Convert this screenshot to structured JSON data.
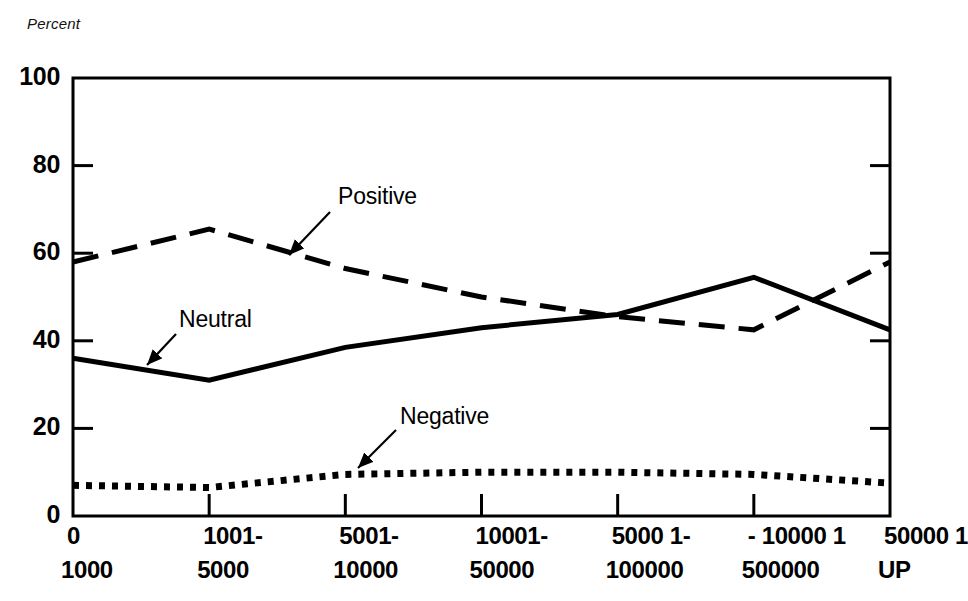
{
  "chart_data": {
    "type": "line",
    "title": "",
    "ylabel": "Percent",
    "xlabel": "",
    "ylim": [
      0,
      100
    ],
    "yticks": [
      "0",
      "20",
      "40",
      "60",
      "80",
      "100"
    ],
    "ytick_values": [
      0,
      20,
      40,
      60,
      80,
      100
    ],
    "grid": false,
    "legend_position": "inline-annotations",
    "categories": [
      "0 1000",
      "1001- 5000",
      "5001- 10000",
      "10001- 50000",
      "5000 1- 100000",
      "- 10000 1 500000",
      "50000 1 UP"
    ],
    "xtick_labels_top": [
      "0",
      "1001-",
      "5001-",
      "10001-",
      "5000 1-",
      "- 10000 1",
      "50000 1"
    ],
    "xtick_labels_bottom": [
      "1000",
      "5000",
      "10000",
      "50000",
      "100000",
      "500000",
      "UP"
    ],
    "series": [
      {
        "name": "Positive",
        "style": "dashed",
        "color": "#000000",
        "values": [
          58,
          65.5,
          56.5,
          50,
          45.5,
          42.5,
          58
        ]
      },
      {
        "name": "Neutral",
        "style": "solid",
        "color": "#000000",
        "values": [
          36,
          31,
          38.5,
          43,
          46,
          54.5,
          42.5
        ]
      },
      {
        "name": "Negative",
        "style": "dotted",
        "color": "#000000",
        "values": [
          7,
          6.5,
          9.5,
          10,
          10,
          9.5,
          7.5
        ]
      }
    ],
    "annotations": [
      {
        "text": "Positive",
        "label_x": 338,
        "label_y": 183,
        "arrow_from_x": 330,
        "arrow_from_y": 212,
        "arrow_to_x": 289,
        "arrow_to_y": 255
      },
      {
        "text": "Neutral",
        "label_x": 179,
        "label_y": 306,
        "arrow_from_x": 176,
        "arrow_from_y": 334,
        "arrow_to_x": 147,
        "arrow_to_y": 365
      },
      {
        "text": "Negative",
        "label_x": 400,
        "label_y": 403,
        "arrow_from_x": 396,
        "arrow_from_y": 430,
        "arrow_to_x": 358,
        "arrow_to_y": 468
      }
    ]
  }
}
